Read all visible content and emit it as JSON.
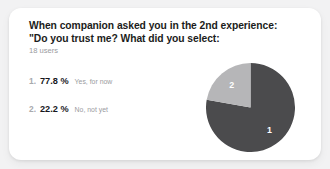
{
  "card": {
    "title_line_1": "When companion asked you in the 2nd experience:",
    "title_line_2": "\"Do you trust me? What did you select:",
    "subtitle": "18 users"
  },
  "legend": {
    "rows": [
      {
        "rank": "1.",
        "percent": "77.8 %",
        "label": "Yes, for now"
      },
      {
        "rank": "2.",
        "percent": "22.2 %",
        "label": "No, not yet"
      }
    ]
  },
  "chart_data": {
    "type": "pie",
    "title": "When companion asked you in the 2nd experience: \"Do you trust me? What did you select:",
    "subtitle": "18 users",
    "categories": [
      "Yes, for now",
      "No, not yet"
    ],
    "values": [
      77.8,
      22.2
    ],
    "value_unit": "%",
    "slice_labels": [
      "1",
      "2"
    ],
    "colors": [
      "#4b4b4d",
      "#b6b6b8"
    ],
    "start_angle_deg": 0,
    "direction": "clockwise",
    "legend_position": "left",
    "grid": false
  },
  "colors": {
    "page_background": "#f2f2f3",
    "card_background": "#ffffff",
    "slice_1": "#4b4b4d",
    "slice_2": "#b6b6b8",
    "title_text": "#1b1c20",
    "muted_text": "#9a9ba0"
  }
}
